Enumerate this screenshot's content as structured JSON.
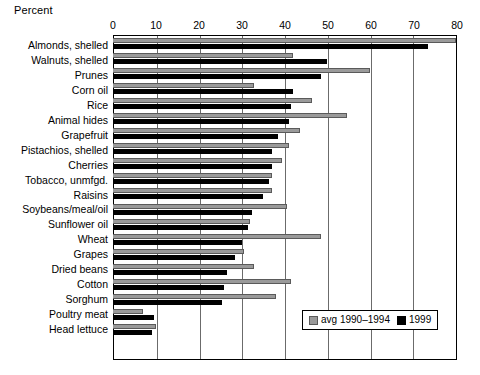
{
  "chart_data": {
    "type": "bar",
    "orientation": "horizontal",
    "title": "",
    "xlabel": "Percent",
    "ylabel": "",
    "xlim": [
      0,
      80
    ],
    "xticks": [
      0,
      10,
      20,
      30,
      40,
      50,
      60,
      70,
      80
    ],
    "grid": true,
    "legend_position": "bottom-right",
    "categories": [
      "Almonds, shelled",
      "Walnuts, shelled",
      "Prunes",
      "Corn oil",
      "Rice",
      "Animal hides",
      "Grapefruit",
      "Pistachios, shelled",
      "Cherries",
      "Tobacco, unmfgd.",
      "Raisins",
      "Soybeans/meal/oil",
      "Sunflower oil",
      "Wheat",
      "Grapes",
      "Dried beans",
      "Cotton",
      "Sorghum",
      "Poultry meat",
      "Head lettuce"
    ],
    "series": [
      {
        "name": "avg 1990–1994",
        "color": "#9a9a9a",
        "values": [
          80.0,
          42.0,
          60.0,
          33.0,
          46.5,
          54.5,
          43.5,
          41.0,
          39.5,
          37.0,
          37.0,
          40.5,
          32.0,
          48.5,
          30.5,
          33.0,
          41.5,
          38.0,
          7.0,
          10.0
        ]
      },
      {
        "name": "1999",
        "color": "#000000",
        "values": [
          73.5,
          50.0,
          48.5,
          42.0,
          41.5,
          41.0,
          38.5,
          37.0,
          37.0,
          36.5,
          35.0,
          32.5,
          31.5,
          30.0,
          28.5,
          26.5,
          26.0,
          25.5,
          9.5,
          9.0
        ]
      }
    ]
  },
  "legend": {
    "items": [
      {
        "label": "avg 1990–1994",
        "swatch": "gray-swatch"
      },
      {
        "label": "1999",
        "swatch": "black-swatch"
      }
    ]
  }
}
